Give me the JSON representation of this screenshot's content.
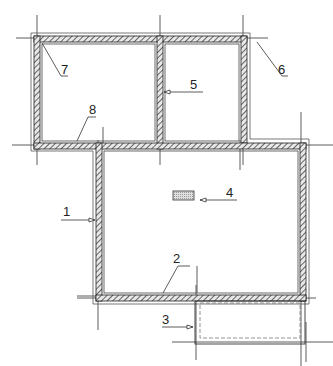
{
  "drawing": {
    "type": "floor-plan",
    "colors": {
      "line": "#222222",
      "wall_hatch": "#555555",
      "grid": "#333333",
      "insulation_fill": "#cccccc"
    },
    "callouts": [
      {
        "id": "1",
        "label": "1",
        "target": "left-wall-lower-block"
      },
      {
        "id": "2",
        "label": "2",
        "target": "bottom-wall-lower-block"
      },
      {
        "id": "3",
        "label": "3",
        "target": "porch"
      },
      {
        "id": "4",
        "label": "4",
        "target": "central-element"
      },
      {
        "id": "5",
        "label": "5",
        "target": "interior-partition"
      },
      {
        "id": "6",
        "label": "6",
        "target": "top-right-corner"
      },
      {
        "id": "7",
        "label": "7",
        "target": "top-left-corner"
      },
      {
        "id": "8",
        "label": "8",
        "target": "bottom-wall-upper-left-room"
      }
    ]
  }
}
